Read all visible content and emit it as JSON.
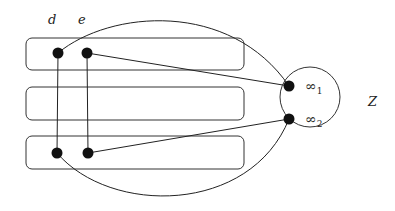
{
  "diagram": {
    "labels": {
      "d": "d",
      "e": "e",
      "Z": "Z",
      "inf1": "∞",
      "inf1_sub": "1",
      "inf2": "∞",
      "inf2_sub": "2"
    },
    "colors": {
      "stroke": "#333333",
      "node": "#111111",
      "background": "#ffffff"
    },
    "boxes": [
      {
        "id": "box-1",
        "x": 26,
        "y": 38,
        "w": 218,
        "h": 32
      },
      {
        "id": "box-2",
        "x": 26,
        "y": 87,
        "w": 218,
        "h": 33
      },
      {
        "id": "box-3",
        "x": 26,
        "y": 136,
        "w": 218,
        "h": 33
      }
    ],
    "nodes": [
      {
        "id": "d-top",
        "x": 58,
        "y": 53
      },
      {
        "id": "e-top",
        "x": 87,
        "y": 53
      },
      {
        "id": "d-bottom",
        "x": 57,
        "y": 153
      },
      {
        "id": "e-bottom",
        "x": 88,
        "y": 153
      },
      {
        "id": "inf1-node",
        "x": 289,
        "y": 86
      },
      {
        "id": "inf2-node",
        "x": 289,
        "y": 119
      }
    ],
    "circle_Z": {
      "cx": 310,
      "cy": 97,
      "r": 30
    }
  }
}
